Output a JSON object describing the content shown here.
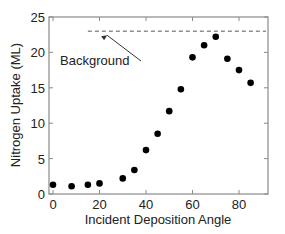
{
  "chart_data": {
    "type": "scatter",
    "title": "",
    "xlabel": "Incident Deposition Angle",
    "ylabel": "Nitrogen Uptake (ML)",
    "xlim": [
      -3,
      92
    ],
    "ylim": [
      0,
      25
    ],
    "xticks": [
      0,
      20,
      40,
      60,
      80
    ],
    "yticks": [
      0,
      5,
      10,
      15,
      20,
      25
    ],
    "grid": false,
    "legend": null,
    "series": [
      {
        "name": "Nitrogen uptake",
        "marker": "filled-circle",
        "color": "#000000",
        "x": [
          0,
          8,
          15,
          20,
          30,
          35,
          40,
          45,
          50,
          55,
          60,
          65,
          70,
          75,
          80,
          85
        ],
        "y": [
          1.3,
          1.1,
          1.3,
          1.5,
          2.2,
          3.4,
          6.2,
          8.5,
          11.7,
          14.8,
          19.3,
          21.0,
          22.2,
          19.1,
          17.5,
          15.7
        ]
      }
    ],
    "reference_line": {
      "label": "Background",
      "y": 23.0,
      "x_start": 15,
      "x_end": 92,
      "style": "dashed",
      "color": "#555555"
    },
    "annotations": [
      {
        "text": "Background",
        "x": 3,
        "y": 18.5,
        "arrow_to": {
          "x": 22,
          "y": 22.7
        }
      }
    ]
  }
}
